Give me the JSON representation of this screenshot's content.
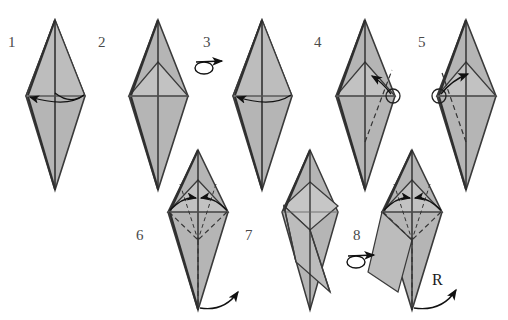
{
  "document": {
    "type": "origami-instruction-diagram",
    "title": "Origami folding sequence",
    "background_color": "#ffffff",
    "width": 508,
    "height": 320
  },
  "style": {
    "paper_fill": "#b5b5b5",
    "paper_fill_light": "#c4c4c4",
    "paper_fill_dark": "#a3a3a3",
    "outline_color": "#3a3a3a",
    "crease_color": "#555555",
    "dashed_color": "#333333",
    "arrow_color": "#111111",
    "label_color": "#4a4a4a"
  },
  "steps": [
    {
      "number": "1",
      "label_x": 8,
      "label_y": 47,
      "caption": "kite base, valley fold across the middle",
      "has_turnover_symbol": false,
      "shape": "tall-rhombus"
    },
    {
      "number": "2",
      "label_x": 98,
      "label_y": 47,
      "caption": "rhombus with inner chevron crease",
      "has_turnover_symbol": false,
      "shape": "rhombus-with-chevron"
    },
    {
      "number": "3",
      "label_x": 203,
      "label_y": 47,
      "caption": "turn the model over",
      "has_turnover_symbol": true,
      "turnover_x": 198,
      "turnover_y": 62,
      "shape": "tall-rhombus"
    },
    {
      "number": "4",
      "label_x": 314,
      "label_y": 47,
      "caption": "fold right flap toward circle marker",
      "has_turnover_symbol": false,
      "marker_side": "right",
      "shape": "rhombus-with-flap"
    },
    {
      "number": "5",
      "label_x": 418,
      "label_y": 47,
      "caption": "fold left flap toward circle marker",
      "has_turnover_symbol": false,
      "marker_side": "left",
      "shape": "rhombus-with-flap"
    },
    {
      "number": "6",
      "label_x": 136,
      "label_y": 240,
      "caption": "squash fold both sides inward, swing point up",
      "has_turnover_symbol": false,
      "shape": "rhombus-squash"
    },
    {
      "number": "7",
      "label_x": 245,
      "label_y": 240,
      "caption": "resulting twisted form",
      "has_turnover_symbol": false,
      "shape": "twisted-form"
    },
    {
      "number": "8",
      "label_x": 353,
      "label_y": 240,
      "caption": "turn the model over",
      "has_turnover_symbol": true,
      "turnover_x": 350,
      "turnover_y": 255,
      "shape": "rhombus-squash"
    }
  ],
  "annotations": {
    "repeat_label": "R",
    "repeat_label_x": 432,
    "repeat_label_y": 285
  }
}
